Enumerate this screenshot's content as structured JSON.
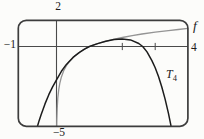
{
  "figure": {
    "background": "#fcfcfa",
    "box_color": "#3d3d3d",
    "axis_color": "#4a4a4a",
    "labels": {
      "y_top": "2",
      "x_left": "−1",
      "x_right": "4",
      "y_bottom": "−5",
      "f_label": "f",
      "t_label_base": "T",
      "t_label_sub": "4"
    }
  },
  "chart_data": {
    "type": "line",
    "title": "",
    "xlabel": "",
    "ylabel": "",
    "x_window": [
      -1,
      4
    ],
    "y_window": [
      -5,
      2
    ],
    "x_axis_end_labels": {
      "left": "−1",
      "right": "4"
    },
    "y_axis_end_labels": {
      "top": "2",
      "bottom": "−5"
    },
    "x_ticks": [
      2,
      3
    ],
    "grid": false,
    "legend_position": "in-plot-annotations",
    "annotations": [
      {
        "text": "f",
        "near": [
          4,
          1.5
        ]
      },
      {
        "text": "T4",
        "near": [
          3.3,
          -2.3
        ]
      }
    ],
    "series": [
      {
        "id": "f",
        "name": "f",
        "description": "f(x) = ln x",
        "color": "#949494",
        "width": 1.3,
        "points": [
          [
            0.005,
            -5
          ],
          [
            0.01,
            -4.61
          ],
          [
            0.02,
            -3.91
          ],
          [
            0.04,
            -3.22
          ],
          [
            0.07,
            -2.66
          ],
          [
            0.1,
            -2.3
          ],
          [
            0.15,
            -1.9
          ],
          [
            0.22,
            -1.51
          ],
          [
            0.3,
            -1.2
          ],
          [
            0.4,
            -0.92
          ],
          [
            0.55,
            -0.6
          ],
          [
            0.7,
            -0.36
          ],
          [
            0.85,
            -0.16
          ],
          [
            1,
            0
          ],
          [
            1.2,
            0.18
          ],
          [
            1.45,
            0.37
          ],
          [
            1.7,
            0.53
          ],
          [
            2,
            0.69
          ],
          [
            2.3,
            0.83
          ],
          [
            2.6,
            0.96
          ],
          [
            3,
            1.1
          ],
          [
            3.4,
            1.22
          ],
          [
            3.7,
            1.31
          ],
          [
            4,
            1.39
          ]
        ]
      },
      {
        "id": "t4",
        "name": "T4",
        "description": "4th-degree Taylor polynomial of ln x at a=1",
        "color": "#1c1c1c",
        "width": 1.5,
        "points": [
          [
            -0.495,
            -5
          ],
          [
            -0.45,
            -4.62
          ],
          [
            -0.4,
            -4.26
          ],
          [
            -0.3,
            -3.59
          ],
          [
            -0.2,
            -3.01
          ],
          [
            -0.1,
            -2.52
          ],
          [
            0,
            -2.08
          ],
          [
            0.15,
            -1.55
          ],
          [
            0.3,
            -1.12
          ],
          [
            0.5,
            -0.68
          ],
          [
            0.7,
            -0.36
          ],
          [
            0.85,
            -0.16
          ],
          [
            1,
            0
          ],
          [
            1.25,
            0.22
          ],
          [
            1.5,
            0.4
          ],
          [
            1.75,
            0.53
          ],
          [
            2,
            0.58
          ],
          [
            2.25,
            0.51
          ],
          [
            2.5,
            0.23
          ],
          [
            2.62,
            0
          ],
          [
            2.75,
            -0.34
          ],
          [
            2.9,
            -0.88
          ],
          [
            3,
            -1.33
          ],
          [
            3.1,
            -1.88
          ],
          [
            3.2,
            -2.53
          ],
          [
            3.3,
            -3.29
          ],
          [
            3.4,
            -4.17
          ],
          [
            3.47,
            -4.86
          ],
          [
            3.49,
            -5.1
          ]
        ]
      }
    ]
  }
}
